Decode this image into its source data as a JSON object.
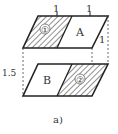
{
  "figure": {
    "caption": "a)",
    "dimensions": {
      "top_left_width": "1",
      "top_right_width": "1",
      "depth": "1",
      "height": "1.5"
    },
    "regions": {
      "top_shaded_label": "①",
      "top_plain_label": "A",
      "bottom_plain_label": "B",
      "bottom_shaded_label": "②"
    },
    "colors": {
      "line": "#222222",
      "hatch": "#333333",
      "background": "#ffffff"
    }
  }
}
